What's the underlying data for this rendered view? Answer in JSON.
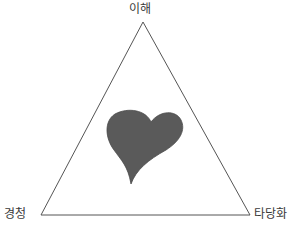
{
  "diagram": {
    "type": "triangle-with-center-symbol",
    "vertices": {
      "top": {
        "label": "이해"
      },
      "bottom_left": {
        "label": "경청"
      },
      "bottom_right": {
        "label": "타당화"
      }
    },
    "center_symbol": {
      "icon": "heart-icon",
      "color": "#5a5a5a"
    },
    "colors": {
      "line": "#555555",
      "text": "#3a3a3a",
      "background": "#ffffff"
    }
  }
}
